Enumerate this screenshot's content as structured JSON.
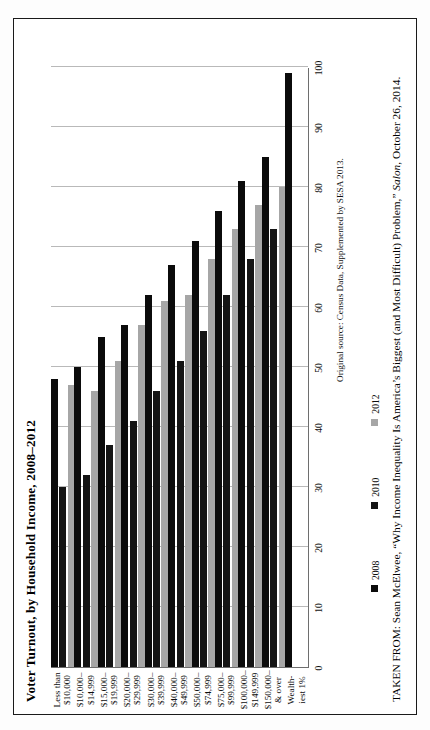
{
  "page": {
    "orientation": "rotated-90-ccw",
    "frame_border_color": "#1a1a1a",
    "background": "#ffffff"
  },
  "figure": {
    "title": "Voter Turnout, by Household Income, 2008–2012",
    "source_note": "Original source: Census Data, Supplemented by SESA 2013.",
    "caption_prefix": "TAKEN FROM: Sean McElwee, “Why Income Inequality Is America’s Biggest (and Most Difficult) Problem,” ",
    "caption_italic": "Salon",
    "caption_suffix": ", October 26, 2014."
  },
  "legend": {
    "position": "below-axis",
    "entries": [
      {
        "label": "2008",
        "color": "#0b0b0b"
      },
      {
        "label": "2010",
        "color": "#141414"
      },
      {
        "label": "2012",
        "color": "#a6a6a6"
      }
    ]
  },
  "chart_data": {
    "type": "bar",
    "title": "Voter Turnout, by Household Income, 2008–2012",
    "xlabel": "",
    "ylabel": "",
    "ylim": [
      0,
      100
    ],
    "yticks": [
      0,
      10,
      20,
      30,
      40,
      50,
      60,
      70,
      80,
      90,
      100
    ],
    "grid": true,
    "orientation": "vertical-bars-printed-sideways",
    "legend_position": "bottom-left",
    "categories": [
      "Less than $10,000",
      "$10,000–$14,999",
      "$15,000–$19,999",
      "$20,000–$29,999",
      "$30,000–$39,999",
      "$40,000–$49,999",
      "$50,000–$74,999",
      "$75,000–$99,999",
      "$100,000–$149,999",
      "$150,000 & over",
      "Wealthiest 1%"
    ],
    "category_lines": [
      [
        "Less than",
        "$10,000"
      ],
      [
        "$10,000–",
        "$14,999"
      ],
      [
        "$15,000–",
        "$19,999"
      ],
      [
        "$20,000–",
        "$29,999"
      ],
      [
        "$30,000–",
        "$39,999"
      ],
      [
        "$40,000–",
        "$49,999"
      ],
      [
        "$50,000–",
        "$74,999"
      ],
      [
        "$75,000–",
        "$99,999"
      ],
      [
        "$100,000–",
        "$149,999"
      ],
      [
        "$150,000–",
        "& over"
      ],
      [
        "Wealth-",
        "iest 1%"
      ]
    ],
    "series": [
      {
        "name": "2008",
        "color": "#0b0b0b",
        "values": [
          48,
          50,
          55,
          57,
          62,
          67,
          71,
          76,
          81,
          85,
          99
        ]
      },
      {
        "name": "2010",
        "color": "#141414",
        "values": [
          30,
          32,
          37,
          41,
          46,
          51,
          56,
          62,
          68,
          73,
          null
        ]
      },
      {
        "name": "2012",
        "color": "#a6a6a6",
        "values": [
          47,
          46,
          51,
          57,
          61,
          62,
          68,
          73,
          77,
          80,
          null
        ]
      }
    ]
  }
}
